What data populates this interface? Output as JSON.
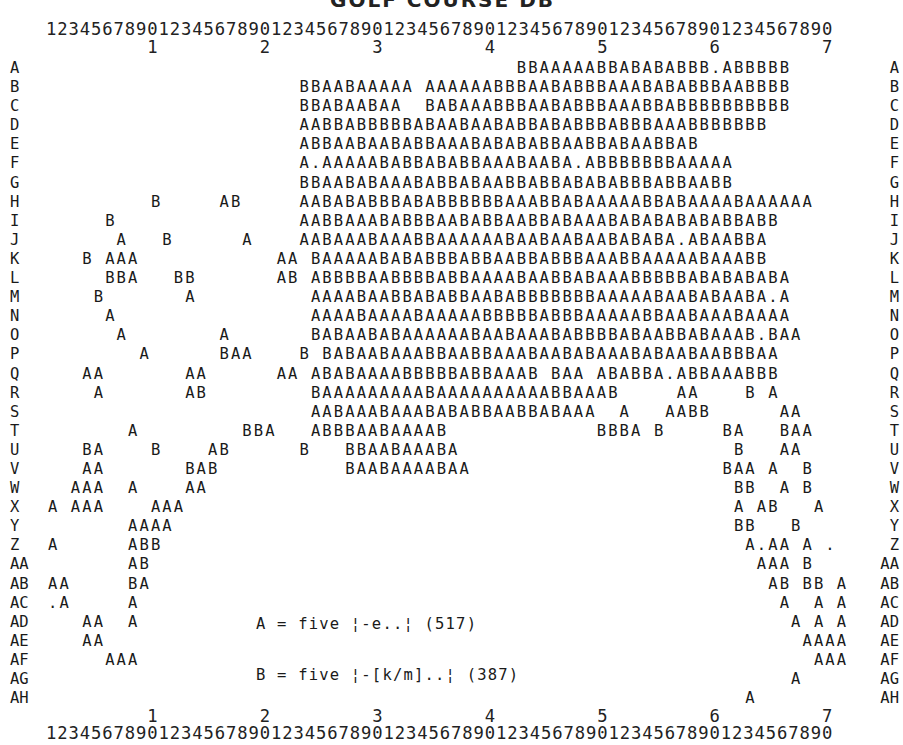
{
  "title": "GOLF COURSE DB",
  "ruler": {
    "units": "1234567890123456789012345678901234567890123456789012345678901234567890",
    "tens": "         1         2         3         4         5         6         7"
  },
  "rows": [
    {
      "label": "A",
      "cells": "                                         BBAAAAABBABABABBB.ABBBBB"
    },
    {
      "label": "B",
      "cells": "                      BBAABAAAAA AAAAAABBBAABABBBAAABABABBBAABBBB"
    },
    {
      "label": "C",
      "cells": "                      BBABAABAA  BABAAABBBAABABBBAAABBABBBBBBBBBB"
    },
    {
      "label": "D",
      "cells": "                      AABBABBBBBABAABAABABBABABBBABBBAAABBBBBBB"
    },
    {
      "label": "E",
      "cells": "                      ABBAABAABABBAAABABABABBAABBABAABBAB"
    },
    {
      "label": "F",
      "cells": "                      A.AAAAABABBABABBAAABAABA.ABBBBBBBAAAAA"
    },
    {
      "label": "G",
      "cells": "                      BBAABABAAABABBABAABBABBABABABBBABBAABB"
    },
    {
      "label": "H",
      "cells": "         B     AB     AABABABBBABABBBBBBAAABBABAAAAABBABAAAABAAAAAA"
    },
    {
      "label": "I",
      "cells": "     B                AABBAAABABBBAABABBAABBABAAABABABABABABBABB"
    },
    {
      "label": "J",
      "cells": "      A   B      A    AABAAABAAABBAAAAAABAABAABAABABABA.ABAABBA"
    },
    {
      "label": "K",
      "cells": "   B AAA            AA BAAAAABABABBBABBAABBABBBAAABBAAAAABAAABB"
    },
    {
      "label": "L",
      "cells": "     BBA   BB       AB ABBBBAABBBBABBAAAABAABBABAAABBBBBABABABABA"
    },
    {
      "label": "M",
      "cells": "    B       A          AAAABAABBABABBAABABBBBBBBAAAAABAABABAABA.A"
    },
    {
      "label": "N",
      "cells": "     A                 AAAABAAAABAAAAABBBBBABBBAAAAABBAABAAABAAAA"
    },
    {
      "label": "O",
      "cells": "      A        A       BABAABABAAAAAABAABAAABABBBBABAABBABAAAB.BAA"
    },
    {
      "label": "P",
      "cells": "        A      BAA    B BABAABAAABBAABBAAABAABABAAABABAABAABBBAA"
    },
    {
      "label": "Q",
      "cells": "   AA       AA      AA ABABAAAABBBBBABBAAAB BAA ABABBA.ABBAAABBB"
    },
    {
      "label": "R",
      "cells": "    A       AB         BAAAAAAAAABAAAAAAAAAABBAAAB     AA    B A"
    },
    {
      "label": "S",
      "cells": "                       AABAAABAAABABABBAABBABAAA  A   AABB      AA"
    },
    {
      "label": "T",
      "cells": "       A         BBA   ABBBAABAAAAB             BBBA B     BA   BAA"
    },
    {
      "label": "U",
      "cells": "   BA    B    AB      B   BBAABAAABA                        B   AA"
    },
    {
      "label": "V",
      "cells": "   AA       BAB           BAABAAAABAA                      BAA A  B"
    },
    {
      "label": "W",
      "cells": "  AAA  A    AA                                              BB  A B"
    },
    {
      "label": "X",
      "cells": "A AAA    AAA                                                A AB   A"
    },
    {
      "label": "Y",
      "cells": "       AAAA                                                 BB   B"
    },
    {
      "label": "Z",
      "cells": "A      ABB                                                   A.AA A ."
    },
    {
      "label": "AA",
      "cells": "       AB                                                     AAA B"
    },
    {
      "label": "AB",
      "cells": "AA     BA                                                      AB BB A"
    },
    {
      "label": "AC",
      "cells": ".A     A                                                        A  A A"
    },
    {
      "label": "AD",
      "cells": "   AA  A                                                         A A A"
    },
    {
      "label": "AE",
      "cells": "   AA                                                             AAAA"
    },
    {
      "label": "AF",
      "cells": "     AAA                                                           AAA"
    },
    {
      "label": "AG",
      "cells": "                                                                 A"
    },
    {
      "label": "AH",
      "cells": "                                                             A"
    }
  ],
  "legend": {
    "line_a": "A = five ¦-e..¦ (517)",
    "line_b": "B = five ¦-[k/m]..¦ (387)"
  },
  "chart_data": {
    "type": "table",
    "columns": 70,
    "row_labels": [
      "A",
      "B",
      "C",
      "D",
      "E",
      "F",
      "G",
      "H",
      "I",
      "J",
      "K",
      "L",
      "M",
      "N",
      "O",
      "P",
      "Q",
      "R",
      "S",
      "T",
      "U",
      "V",
      "W",
      "X",
      "Y",
      "Z",
      "AA",
      "AB",
      "AC",
      "AD",
      "AE",
      "AF",
      "AG",
      "AH"
    ],
    "legend": [
      {
        "symbol": "A",
        "meaning": "five |-e..|",
        "count": 517
      },
      {
        "symbol": "B",
        "meaning": "five |-[k/m]..|",
        "count": 387
      }
    ]
  }
}
